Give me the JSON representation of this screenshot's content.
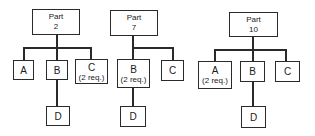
{
  "diagram": {
    "type": "product-structure-trees",
    "trees": [
      {
        "root": {
          "label": "Part",
          "number": "2"
        },
        "children": [
          {
            "label": "A",
            "note": ""
          },
          {
            "label": "B",
            "note": "",
            "children": [
              {
                "label": "D"
              }
            ]
          },
          {
            "label": "C",
            "note": "(2 req.)"
          }
        ]
      },
      {
        "root": {
          "label": "Part",
          "number": "7"
        },
        "children": [
          {
            "label": "B",
            "note": "(2 req.)",
            "children": [
              {
                "label": "D"
              }
            ]
          },
          {
            "label": "C",
            "note": ""
          }
        ]
      },
      {
        "root": {
          "label": "Part",
          "number": "10"
        },
        "children": [
          {
            "label": "A",
            "note": "(2 req.)"
          },
          {
            "label": "B",
            "note": "",
            "children": [
              {
                "label": "D"
              }
            ]
          },
          {
            "label": "C",
            "note": ""
          }
        ]
      }
    ]
  }
}
